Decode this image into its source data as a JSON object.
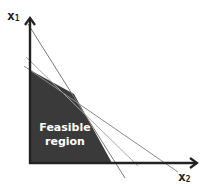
{
  "diagram": {
    "type": "linear-programming-feasible-region",
    "axes": {
      "vertical": {
        "name": "x",
        "subscript": "1"
      },
      "horizontal": {
        "name": "x",
        "subscript": "2"
      }
    },
    "region": {
      "label_line1": "Feasible",
      "label_line2": "region",
      "fill_color": "#3a3a3a",
      "label_color": "#ffffff"
    },
    "constraint_lines": [
      {
        "id": "constraint-1",
        "color": "#7a7a7a"
      },
      {
        "id": "constraint-2",
        "color": "#a8a8a8"
      },
      {
        "id": "constraint-3",
        "color": "#8a8a8a"
      }
    ],
    "colors": {
      "axis": "#222222",
      "background": "#ffffff"
    }
  }
}
